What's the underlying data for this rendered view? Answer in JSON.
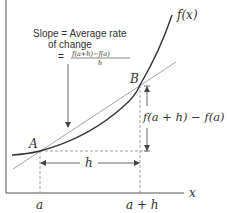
{
  "diagram": {
    "annotation": {
      "line1": "Slope = Average rate",
      "line2": "of change",
      "equals": "=",
      "numerator": "f(a+h)−f(a)",
      "denominator": "h"
    },
    "curve_label": "f(x)",
    "point_a_label": "A",
    "point_b_label": "B",
    "rise_label": "f(a + h) − f(a)",
    "run_label": "h",
    "x_axis_label": "x",
    "x_tick_a": "a",
    "x_tick_a_plus_h": "a + h",
    "colors": {
      "curve": "#333333",
      "secant": "#9a9a9a",
      "axis": "#555555",
      "dashed": "#888888",
      "text": "#333333"
    }
  }
}
